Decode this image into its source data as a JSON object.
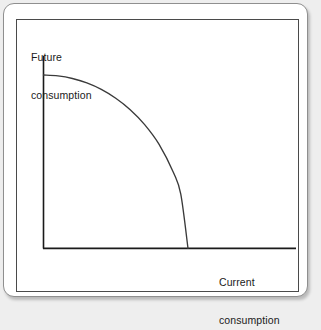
{
  "figure": {
    "background_color": "#eeeeee",
    "card_color": "#ffffff",
    "card_border_color": "#8f8f8f",
    "frame_border_color": "#4a4a4a",
    "axis_color": "#1a1a1a",
    "curve_color": "#3a3a3a"
  },
  "labels": {
    "y_axis": {
      "line1": "Future",
      "line2": "consumption",
      "full": "Future consumption"
    },
    "x_axis": {
      "line1": "Current",
      "line2": "consumption",
      "full": "Current consumption"
    }
  },
  "chart_data": {
    "type": "line",
    "title": "",
    "subtitle": "",
    "xlabel": "Current consumption",
    "ylabel": "Future consumption",
    "grid": false,
    "legend": null,
    "axis_ticks": {
      "x": [],
      "y": []
    },
    "xlim": [
      0,
      1
    ],
    "ylim": [
      0,
      1
    ],
    "series": [
      {
        "name": "Intertemporal consumption frontier",
        "shape": "concave-quarter-ellipse",
        "x": [
          0.0,
          0.1,
          0.2,
          0.3,
          0.4,
          0.5,
          0.6,
          0.7,
          0.8,
          0.9,
          0.95,
          1.0
        ],
        "values": [
          1.0,
          0.995,
          0.98,
          0.954,
          0.917,
          0.866,
          0.8,
          0.714,
          0.6,
          0.436,
          0.312,
          0.0
        ]
      }
    ],
    "annotations": [
      {
        "text": "Future consumption",
        "position": "axis-y-top-left"
      },
      {
        "text": "Current consumption",
        "position": "axis-x-below-right"
      }
    ]
  }
}
